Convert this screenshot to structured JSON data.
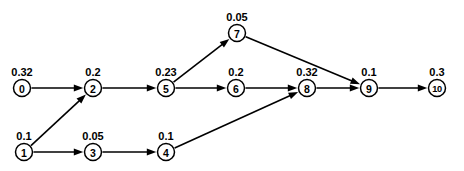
{
  "diagram": {
    "type": "directed-graph",
    "title": "",
    "background_color": "#ffffff",
    "stroke_color": "#000000",
    "node_fill": "#ffffff",
    "node_radius": 8.5,
    "nodes": [
      {
        "id": "0",
        "label": "0",
        "weight": "0.32",
        "x": 22,
        "y": 88,
        "weight_x": 22,
        "weight_y": 72
      },
      {
        "id": "1",
        "label": "1",
        "weight": "0.1",
        "x": 24,
        "y": 152,
        "weight_x": 24,
        "weight_y": 136
      },
      {
        "id": "2",
        "label": "2",
        "weight": "0.2",
        "x": 93,
        "y": 88,
        "weight_x": 93,
        "weight_y": 72
      },
      {
        "id": "3",
        "label": "3",
        "weight": "0.05",
        "x": 93,
        "y": 152,
        "weight_x": 93,
        "weight_y": 136
      },
      {
        "id": "4",
        "label": "4",
        "weight": "0.1",
        "x": 166,
        "y": 152,
        "weight_x": 166,
        "weight_y": 136
      },
      {
        "id": "5",
        "label": "5",
        "weight": "0.23",
        "x": 166,
        "y": 88,
        "weight_x": 166,
        "weight_y": 72
      },
      {
        "id": "6",
        "label": "6",
        "weight": "0.2",
        "x": 236,
        "y": 88,
        "weight_x": 236,
        "weight_y": 72
      },
      {
        "id": "7",
        "label": "7",
        "weight": "0.05",
        "x": 237,
        "y": 33,
        "weight_x": 237,
        "weight_y": 17
      },
      {
        "id": "8",
        "label": "8",
        "weight": "0.32",
        "x": 307,
        "y": 88,
        "weight_x": 307,
        "weight_y": 72
      },
      {
        "id": "9",
        "label": "9",
        "weight": "0.1",
        "x": 369,
        "y": 88,
        "weight_x": 369,
        "weight_y": 72
      },
      {
        "id": "10",
        "label": "10",
        "weight": "0.3",
        "x": 437,
        "y": 88,
        "weight_x": 437,
        "weight_y": 72
      }
    ],
    "edges": [
      {
        "from": "0",
        "to": "2",
        "name": "edge-0-2"
      },
      {
        "from": "1",
        "to": "2",
        "name": "edge-1-2"
      },
      {
        "from": "1",
        "to": "3",
        "name": "edge-1-3"
      },
      {
        "from": "3",
        "to": "4",
        "name": "edge-3-4"
      },
      {
        "from": "2",
        "to": "5",
        "name": "edge-2-5"
      },
      {
        "from": "5",
        "to": "7",
        "name": "edge-5-7"
      },
      {
        "from": "5",
        "to": "6",
        "name": "edge-5-6"
      },
      {
        "from": "6",
        "to": "8",
        "name": "edge-6-8"
      },
      {
        "from": "4",
        "to": "8",
        "name": "edge-4-8"
      },
      {
        "from": "7",
        "to": "9",
        "name": "edge-7-9"
      },
      {
        "from": "8",
        "to": "9",
        "name": "edge-8-9"
      },
      {
        "from": "9",
        "to": "10",
        "name": "edge-9-10"
      }
    ]
  }
}
